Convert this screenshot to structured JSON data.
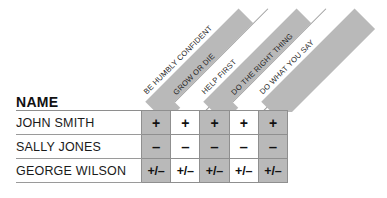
{
  "table": {
    "name_column_header": "NAME",
    "criteria": [
      {
        "label": "BE HUMBLY CONFIDENT",
        "shaded": true
      },
      {
        "label": "GROW OR DIE",
        "shaded": false
      },
      {
        "label": "HELP FIRST",
        "shaded": true
      },
      {
        "label": "DO THE RIGHT THING",
        "shaded": false
      },
      {
        "label": "DO WHAT YOU SAY",
        "shaded": true
      }
    ],
    "rows": [
      {
        "name": "JOHN SMITH",
        "marks": [
          "+",
          "+",
          "+",
          "+",
          "+"
        ]
      },
      {
        "name": "SALLY JONES",
        "marks": [
          "–",
          "–",
          "–",
          "–",
          "–"
        ]
      },
      {
        "name": "GEORGE WILSON",
        "marks": [
          "+/–",
          "+/–",
          "+/–",
          "+/–",
          "+/–"
        ]
      }
    ]
  },
  "colors": {
    "shade_gray": "#b9b9b9",
    "rule_gray": "#8f8f8f",
    "text_dark": "#1a1a1a",
    "background": "#ffffff"
  }
}
